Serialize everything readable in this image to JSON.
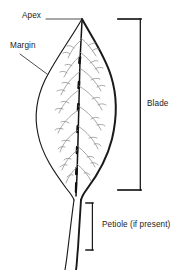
{
  "diagram": {
    "background_color": "#ffffff",
    "outline_color": "#1a1a1a",
    "vein_color": "#8b8b8b",
    "midrib_color": "#111111",
    "label_color": "#1b1b1b",
    "leader_color": "#4a4a4a",
    "bracket_color": "#1a1a1a"
  },
  "labels": {
    "apex": "Apex",
    "margin": "Margin",
    "blade": "Blade",
    "petiole": "Petiole (if present)"
  },
  "parts": {
    "apex": {
      "name": "Apex",
      "description": "pointed tip of the leaf blade",
      "leader": "horizontal-line-right"
    },
    "margin": {
      "name": "Margin",
      "description": "entire smooth edge of the leaf blade",
      "leader": "diagonal-line-down-right"
    },
    "blade": {
      "name": "Blade",
      "description": "flat expanded lamina of the leaf",
      "marker": "square-bracket-vertical"
    },
    "petiole": {
      "name": "Petiole (if present)",
      "description": "stalk attaching the blade to the stem",
      "marker": "square-bracket-vertical"
    }
  },
  "icons": {
    "apex_leader": "leader-line-icon",
    "margin_leader": "leader-line-icon",
    "blade_bracket": "bracket-icon",
    "petiole_bracket": "bracket-icon"
  }
}
